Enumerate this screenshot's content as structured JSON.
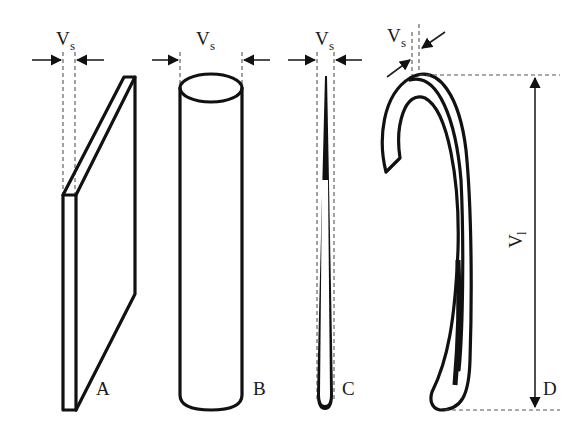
{
  "diagram": {
    "title": "",
    "colors": {
      "line": "#111111",
      "dash": "#555555",
      "background": "#ffffff"
    },
    "figures": [
      {
        "id": "A",
        "label": "A",
        "shape": "plate",
        "dimension": {
          "symbol": "V",
          "subscript": "s"
        }
      },
      {
        "id": "B",
        "label": "B",
        "shape": "cylinder",
        "dimension": {
          "symbol": "V",
          "subscript": "s"
        }
      },
      {
        "id": "C",
        "label": "C",
        "shape": "needle",
        "dimension": {
          "symbol": "V",
          "subscript": "s"
        }
      },
      {
        "id": "D",
        "label": "D",
        "shape": "curved-rod",
        "dimension": {
          "symbol": "V",
          "subscript": "s"
        },
        "length_dimension": {
          "symbol": "V",
          "subscript": "l"
        }
      }
    ]
  }
}
